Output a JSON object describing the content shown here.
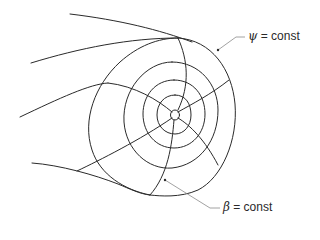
{
  "figure": {
    "type": "flux-surface-coordinate-diagram",
    "labels": {
      "psi": {
        "symbol": "ψ",
        "text": " = const",
        "full": "ψ = const"
      },
      "beta": {
        "symbol": "β",
        "text": " = const",
        "full": "β = const"
      }
    },
    "colors": {
      "line": "#2a2a2a",
      "leader": "#8a8a8a",
      "background": "#ffffff"
    },
    "nested_surfaces_count": 5,
    "radial_lines_count": 5
  }
}
